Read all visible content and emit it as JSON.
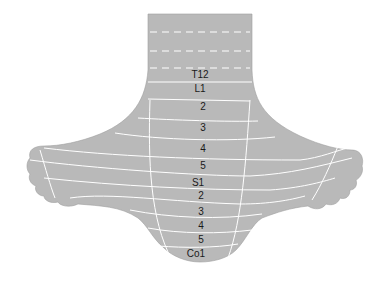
{
  "diagram": {
    "colors": {
      "skin": "#b8b8b8",
      "skin_light": "#c4c4c4",
      "lines": "#ffffff",
      "text": "#1a1a1a",
      "background": "#ffffff"
    },
    "segments": [
      {
        "label": "T12",
        "x": 200,
        "y": 75
      },
      {
        "label": "L1",
        "x": 200,
        "y": 89
      },
      {
        "label": "2",
        "x": 203,
        "y": 107
      },
      {
        "label": "3",
        "x": 203,
        "y": 128
      },
      {
        "label": "4",
        "x": 203,
        "y": 149
      },
      {
        "label": "5",
        "x": 203,
        "y": 166
      },
      {
        "label": "S1",
        "x": 198,
        "y": 183
      },
      {
        "label": "2",
        "x": 201,
        "y": 196
      },
      {
        "label": "3",
        "x": 201,
        "y": 212
      },
      {
        "label": "4",
        "x": 201,
        "y": 226
      },
      {
        "label": "5",
        "x": 201,
        "y": 240
      },
      {
        "label": "Co1",
        "x": 196,
        "y": 254
      }
    ]
  }
}
